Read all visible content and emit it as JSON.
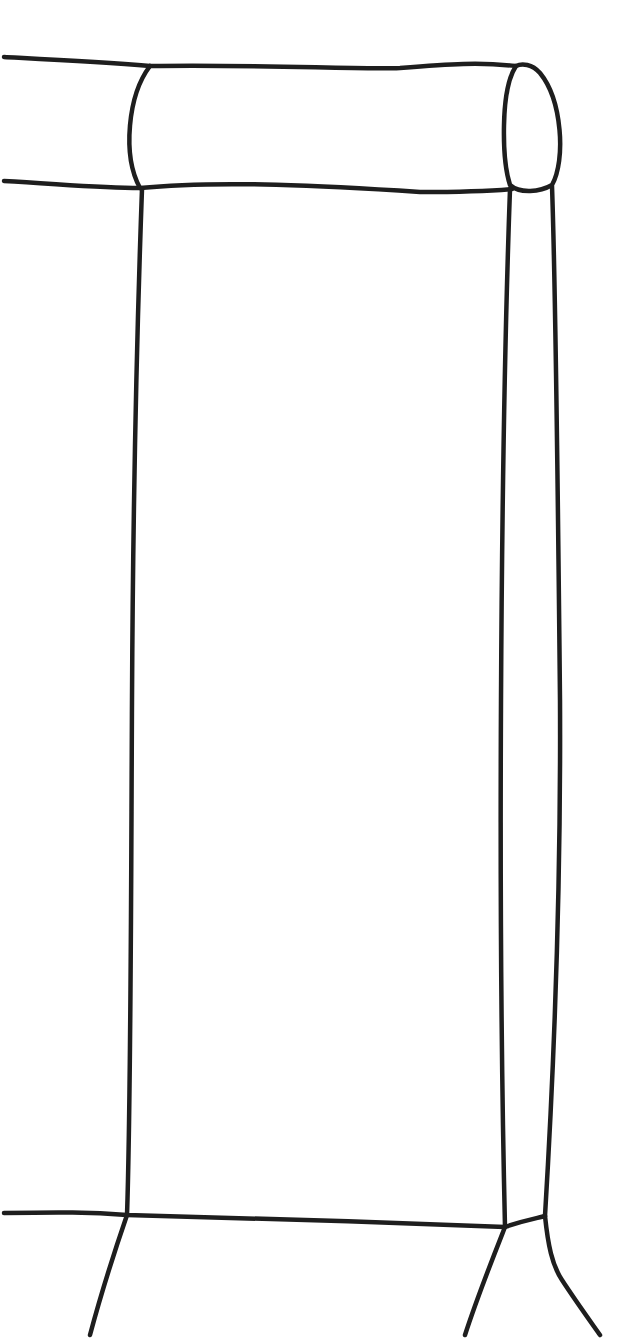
{
  "drawing": {
    "subject": "line sketch of furniture end (bolster arm, front panel, side panel, legs)",
    "stroke_color": "#1e1e1e",
    "background_color": "#ffffff",
    "stroke_width": 4.5,
    "strokes": [
      {
        "name": "bolster-top-edge",
        "d": "M 4 57 C 60 60, 100 62, 150 66 C 260 64, 360 70, 400 68 C 450 64, 480 62, 516 66"
      },
      {
        "name": "bolster-bottom-edge",
        "d": "M 4 181 C 60 184, 100 188, 140 188 C 220 180, 330 186, 420 192 C 460 192, 490 191, 512 189"
      },
      {
        "name": "bolster-left-seam",
        "d": "M 150 66 C 128 95, 122 155, 140 188"
      },
      {
        "name": "bolster-end-cap",
        "d": "M 516 66 C 500 90, 502 160, 510 185 C 520 194, 540 192, 552 185 C 566 160, 562 100, 540 73 C 532 64, 522 63, 516 66 Z"
      },
      {
        "name": "front-panel-left-edge",
        "d": "M 142 189 C 138 300, 133 500, 132 700 C 131 900, 131 1100, 127 1215"
      },
      {
        "name": "front-panel-right-edge",
        "d": "M 510 189 C 506 300, 502 500, 501 700 C 500 900, 502 1100, 505 1227"
      },
      {
        "name": "side-panel-back-edge",
        "d": "M 552 186 C 556 300, 558 500, 560 700 C 561 900, 552 1100, 545 1216"
      },
      {
        "name": "base-rail",
        "d": "M 4 1213 C 60 1212, 90 1212, 127 1215 C 250 1218, 380 1222, 505 1227 C 525 1220, 538 1218, 545 1216"
      },
      {
        "name": "front-left-leg",
        "d": "M 127 1215 C 115 1250, 102 1290, 90 1335"
      },
      {
        "name": "front-right-leg",
        "d": "M 505 1227 C 492 1260, 478 1295, 465 1335"
      },
      {
        "name": "back-right-leg",
        "d": "M 545 1216 C 548 1245, 552 1265, 562 1280 C 575 1300, 588 1318, 600 1335"
      }
    ]
  }
}
